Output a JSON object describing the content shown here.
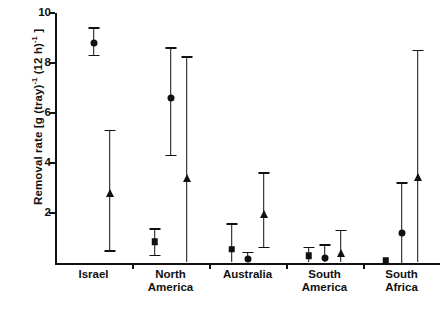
{
  "chart_data": {
    "type": "scatter",
    "title": "",
    "xlabel": "",
    "ylabel": "Removal rate [g (tray)⁻¹ (12 h)⁻¹]",
    "ylabel_parts": {
      "prefix": "Removal rate [g (tray)",
      "sup1": "-1",
      "mid": " (12 h)",
      "sup2": "-1",
      "suffix": " ]"
    },
    "categories": [
      "Israel",
      "North America",
      "Australia",
      "South America",
      "South Africa"
    ],
    "category_labels": [
      {
        "line1": "Israel",
        "line2": ""
      },
      {
        "line1": "North",
        "line2": "America"
      },
      {
        "line1": "Australia",
        "line2": ""
      },
      {
        "line1": "South",
        "line2": "America"
      },
      {
        "line1": "South",
        "line2": "Africa"
      }
    ],
    "ylim": [
      0,
      10
    ],
    "yticks": [
      2,
      4,
      6,
      8,
      10
    ],
    "ytick_labels": [
      "2",
      "4",
      "6",
      "8",
      "10"
    ],
    "grid": false,
    "legend": "none",
    "marker_shapes": [
      "square",
      "circle",
      "triangle"
    ],
    "series": [
      {
        "name": "square",
        "marker": "square",
        "values": [
          null,
          0.85,
          0.55,
          0.3,
          0.12
        ],
        "err_low": [
          null,
          0.3,
          0.05,
          0.05,
          0.12
        ],
        "err_high": [
          null,
          1.35,
          1.55,
          0.62,
          0.12
        ]
      },
      {
        "name": "circle",
        "marker": "circle",
        "values": [
          8.8,
          6.6,
          0.15,
          0.22,
          1.2
        ],
        "err_low": [
          8.3,
          4.3,
          0.05,
          0.05,
          0.02
        ],
        "err_high": [
          9.4,
          8.6,
          0.42,
          0.72,
          3.2
        ]
      },
      {
        "name": "triangle",
        "marker": "triangle",
        "values": [
          2.8,
          3.4,
          1.95,
          0.42,
          3.45
        ],
        "err_low": [
          0.48,
          0.05,
          0.62,
          0.05,
          0.05
        ],
        "err_high": [
          5.3,
          8.25,
          3.6,
          1.3,
          8.5
        ]
      }
    ],
    "colors": {
      "ink": "#111111",
      "background": "#ffffff"
    }
  }
}
